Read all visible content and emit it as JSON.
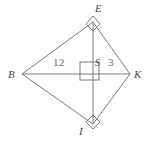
{
  "figure": {
    "type": "geometry-diagram",
    "shape": "kite",
    "stroke_color": "#7a7a7a",
    "label_color": "#4a4a4a",
    "measure_color": "#6a6a6a",
    "background": "#ffffff",
    "vertices": [
      {
        "name": "E",
        "label": "E",
        "x": 93,
        "y": 22
      },
      {
        "name": "B",
        "label": "B",
        "x": 22,
        "y": 74
      },
      {
        "name": "K",
        "label": "K",
        "x": 130,
        "y": 74
      },
      {
        "name": "I",
        "label": "I",
        "x": 93,
        "y": 124
      },
      {
        "name": "S",
        "label": "S",
        "x": 93,
        "y": 74
      }
    ],
    "sides": [
      {
        "name": "BE",
        "from": "B",
        "to": "E"
      },
      {
        "name": "EK",
        "from": "E",
        "to": "K"
      },
      {
        "name": "KI",
        "from": "K",
        "to": "I"
      },
      {
        "name": "IB",
        "from": "I",
        "to": "B"
      }
    ],
    "diagonals": [
      {
        "name": "BK",
        "from": "B",
        "to": "K",
        "orientation": "horizontal"
      },
      {
        "name": "EI",
        "from": "E",
        "to": "I",
        "orientation": "vertical"
      }
    ],
    "measures": [
      {
        "name": "BS",
        "label": "12",
        "segment": "B-S"
      },
      {
        "name": "SK",
        "label": "3",
        "segment": "S-K"
      }
    ],
    "right_angle_marks": [
      {
        "name": "right-angle-at-E",
        "at": "E"
      },
      {
        "name": "right-angle-at-S",
        "at": "S"
      },
      {
        "name": "right-angle-at-I",
        "at": "I"
      }
    ]
  }
}
